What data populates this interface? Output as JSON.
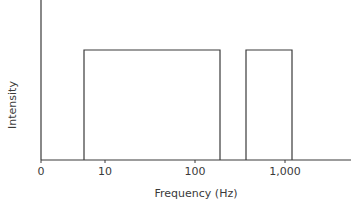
{
  "chart_data": {
    "type": "bar",
    "title": "",
    "xlabel": "Frequency (Hz)",
    "ylabel": "Intensity",
    "x_scale": "log",
    "x_ticks": [
      {
        "label": "0",
        "px": 41
      },
      {
        "label": "10",
        "px": 105
      },
      {
        "label": "100",
        "px": 195
      },
      {
        "label": "1,000",
        "px": 285
      }
    ],
    "series": [
      {
        "name": "band-1",
        "x_start_hz": 6,
        "x_end_hz": 190,
        "intensity": 1.0,
        "px": {
          "x0": 84,
          "x1": 220
        }
      },
      {
        "name": "band-2",
        "x_start_hz": 370,
        "x_end_hz": 1200,
        "intensity": 1.0,
        "px": {
          "x0": 246,
          "x1": 292
        }
      }
    ],
    "grid": false,
    "legend": null,
    "colors": {
      "line": "#3a3a3a",
      "background": "#ffffff"
    }
  }
}
